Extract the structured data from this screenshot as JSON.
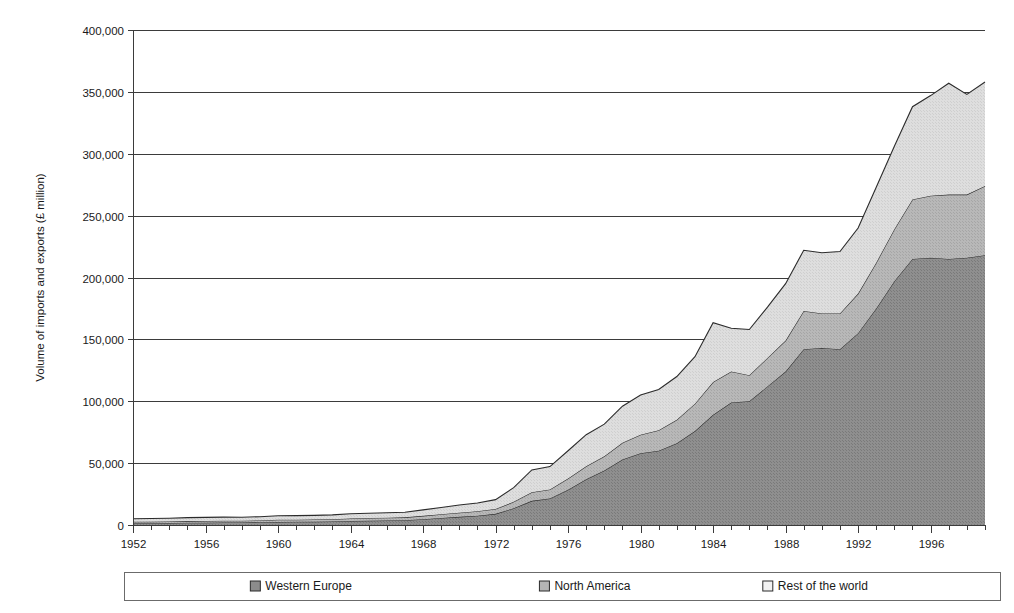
{
  "chart_data": {
    "type": "area",
    "stacked": true,
    "title": "",
    "xlabel": "",
    "ylabel": "Volume of imports and exports (£ million)",
    "ylim": [
      0,
      400000
    ],
    "xlim": [
      1952,
      1999
    ],
    "grid": true,
    "y_ticks": [
      0,
      50000,
      100000,
      150000,
      200000,
      250000,
      300000,
      350000,
      400000
    ],
    "y_tick_labels": [
      "0",
      "50,000",
      "100,000",
      "150,000",
      "200,000",
      "250,000",
      "300,000",
      "350,000",
      "400,000"
    ],
    "x_ticks_labeled": [
      1952,
      1956,
      1960,
      1964,
      1968,
      1972,
      1976,
      1980,
      1984,
      1988,
      1992,
      1996
    ],
    "x_tick_labels": [
      "1952",
      "1956",
      "1960",
      "1964",
      "1968",
      "1972",
      "1976",
      "1980",
      "1984",
      "1988",
      "1992",
      "1996"
    ],
    "legend_position": "bottom",
    "x": [
      1952,
      1953,
      1954,
      1955,
      1956,
      1957,
      1958,
      1959,
      1960,
      1961,
      1962,
      1963,
      1964,
      1965,
      1966,
      1967,
      1968,
      1969,
      1970,
      1971,
      1972,
      1973,
      1974,
      1975,
      1976,
      1977,
      1978,
      1979,
      1980,
      1981,
      1982,
      1983,
      1984,
      1985,
      1986,
      1987,
      1988,
      1989,
      1990,
      1991,
      1992,
      1993,
      1994,
      1995,
      1996,
      1997,
      1998,
      1999
    ],
    "series": [
      {
        "name": "Western Europe",
        "color": "#8c8c8c",
        "values": [
          1400,
          1500,
          1600,
          1800,
          1900,
          2000,
          2000,
          2200,
          2500,
          2600,
          2700,
          2900,
          3300,
          3500,
          3700,
          3900,
          4700,
          5600,
          6600,
          7500,
          9000,
          13500,
          19500,
          21500,
          28500,
          37000,
          44000,
          53000,
          58000,
          60000,
          66000,
          76000,
          89000,
          99000,
          100000,
          112000,
          124000,
          142000,
          143000,
          142000,
          155000,
          175000,
          197000,
          215000,
          216000,
          215000,
          216000,
          218000
        ]
      },
      {
        "name": "North America",
        "color": "#b5b5b5",
        "values": [
          1200,
          1200,
          1250,
          1350,
          1400,
          1450,
          1400,
          1500,
          1700,
          1700,
          1700,
          1800,
          2000,
          2100,
          2200,
          2300,
          2700,
          3100,
          3400,
          3600,
          4000,
          5200,
          7000,
          7200,
          9000,
          10500,
          11500,
          13500,
          15000,
          16500,
          19000,
          22000,
          26500,
          25000,
          21000,
          23000,
          25000,
          31000,
          28000,
          29000,
          32000,
          37000,
          42000,
          48000,
          50000,
          52000,
          51000,
          56000
        ]
      },
      {
        "name": "Rest of the world",
        "color": "#dcdcdc",
        "values": [
          2400,
          2500,
          2600,
          2800,
          2900,
          2950,
          2900,
          3000,
          3300,
          3300,
          3400,
          3500,
          3800,
          3900,
          4000,
          4100,
          4800,
          5500,
          6200,
          6700,
          7500,
          11500,
          18000,
          18500,
          22500,
          25500,
          26000,
          29500,
          32000,
          33000,
          35000,
          38000,
          48000,
          35000,
          37000,
          41000,
          46000,
          49000,
          49000,
          50000,
          53000,
          61000,
          67000,
          75000,
          81000,
          90000,
          81000,
          84000
        ]
      }
    ]
  },
  "legend": {
    "items": [
      {
        "label": "Western Europe",
        "color": "#8c8c8c"
      },
      {
        "label": "North America",
        "color": "#b5b5b5"
      },
      {
        "label": "Rest of the world",
        "color": "#f2f2f2"
      }
    ]
  }
}
